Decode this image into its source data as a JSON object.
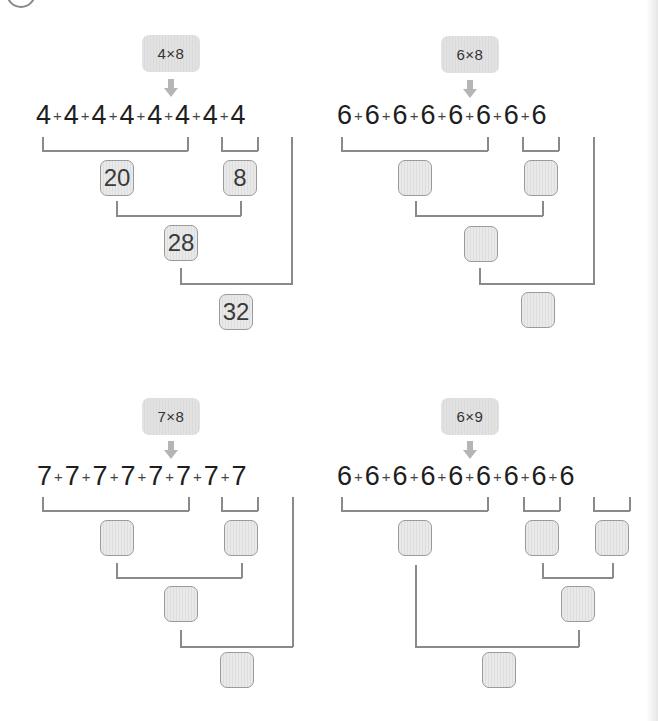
{
  "worksheet": {
    "problems": [
      {
        "id": "p1",
        "label": "4×8",
        "addends": [
          "4",
          "4",
          "4",
          "4",
          "4",
          "4",
          "4",
          "4"
        ],
        "plus": "+",
        "answers": {
          "group_a": "20",
          "group_b": "8",
          "partial": "28",
          "total": "32"
        }
      },
      {
        "id": "p2",
        "label": "6×8",
        "addends": [
          "6",
          "6",
          "6",
          "6",
          "6",
          "6",
          "6",
          "6"
        ],
        "plus": "+",
        "answers": {
          "group_a": "",
          "group_b": "",
          "partial": "",
          "total": ""
        }
      },
      {
        "id": "p3",
        "label": "7×8",
        "addends": [
          "7",
          "7",
          "7",
          "7",
          "7",
          "7",
          "7",
          "7"
        ],
        "plus": "+",
        "answers": {
          "group_a": "",
          "group_b": "",
          "partial": "",
          "total": ""
        }
      },
      {
        "id": "p4",
        "label": "6×9",
        "addends": [
          "6",
          "6",
          "6",
          "6",
          "6",
          "6",
          "6",
          "6",
          "6"
        ],
        "plus": "+",
        "answers": {
          "group_a": "",
          "group_b": "",
          "group_c": "",
          "partial": "",
          "total": ""
        }
      }
    ],
    "colors": {
      "box_fill": "#e6e6e6",
      "box_border": "#9a9a9a",
      "label_fill": "#e0e0e0",
      "arrow": "#b5b5b5",
      "bracket_line": "#8a8a8a",
      "text": "#1e1e1e"
    }
  }
}
